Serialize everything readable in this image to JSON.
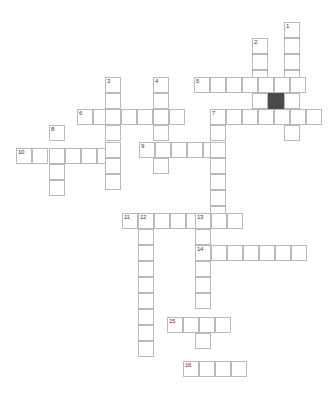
{
  "puzzle": {
    "type": "crossword-grid",
    "title": "Crossword Puzzle Grid",
    "cell_size_px": 16,
    "origin": {
      "x": 16,
      "y": 22
    },
    "colors": {
      "background": "#ffffff",
      "cell_fill": "#ffffff",
      "cell_border": "#b9b9b9",
      "blocked_fill": "#4a4a4a",
      "number_text": "#3a3a3a"
    },
    "counts": {
      "open_cells": 93,
      "blocked_cells": 1,
      "numbered_cells": 16
    },
    "clue_numbers": [
      "1",
      "2",
      "3",
      "4",
      "5",
      "6",
      "7",
      "8",
      "9",
      "10",
      "11",
      "12",
      "13",
      "14",
      "15",
      "16"
    ],
    "entries": [
      {
        "number": "1",
        "direction": "down",
        "col": 17,
        "row": 0,
        "length": 8
      },
      {
        "number": "2",
        "direction": "down",
        "col": 15,
        "row": 1,
        "length": 6
      },
      {
        "number": "3",
        "direction": "down",
        "col": 6,
        "row": 4,
        "length": 7
      },
      {
        "number": "4",
        "direction": "down",
        "col": 9,
        "row": 4,
        "length": 6
      },
      {
        "number": "5",
        "direction": "across",
        "col": 11,
        "row": 4,
        "length": 7
      },
      {
        "number": "6",
        "direction": "across",
        "col": 4,
        "row": 6,
        "length": 8
      },
      {
        "number": "7",
        "direction": "across",
        "col": 12,
        "row": 7,
        "length": 7
      },
      {
        "number": "7",
        "direction": "down",
        "col": 12,
        "row": 7,
        "length": 8
      },
      {
        "number": "8",
        "direction": "down",
        "col": 2,
        "row": 7,
        "length": 4
      },
      {
        "number": "9",
        "direction": "across",
        "col": 7,
        "row": 9,
        "length": 6
      },
      {
        "number": "10",
        "direction": "across",
        "col": 0,
        "row": 9,
        "length": 6
      },
      {
        "number": "11",
        "direction": "across",
        "col": 7,
        "row": 13,
        "length": 8
      },
      {
        "number": "12",
        "direction": "down",
        "col": 8,
        "row": 13,
        "length": 10
      },
      {
        "number": "13",
        "direction": "down",
        "col": 11,
        "row": 13,
        "length": 11
      },
      {
        "number": "14",
        "direction": "across",
        "col": 11,
        "row": 15,
        "length": 7
      },
      {
        "number": "15",
        "direction": "across",
        "col": 9,
        "row": 20,
        "length": 4
      },
      {
        "number": "16",
        "direction": "across",
        "col": 10,
        "row": 23,
        "length": 4
      }
    ],
    "cells": [
      {
        "x": 284,
        "y": 22,
        "num": "1"
      },
      {
        "x": 284,
        "y": 38
      },
      {
        "x": 252,
        "y": 38,
        "num": "2"
      },
      {
        "x": 284,
        "y": 54
      },
      {
        "x": 252,
        "y": 54
      },
      {
        "x": 284,
        "y": 70
      },
      {
        "x": 252,
        "y": 70
      },
      {
        "x": 194,
        "y": 77,
        "num": "5"
      },
      {
        "x": 210,
        "y": 77
      },
      {
        "x": 226,
        "y": 77
      },
      {
        "x": 242,
        "y": 77
      },
      {
        "x": 258,
        "y": 77
      },
      {
        "x": 274,
        "y": 77
      },
      {
        "x": 290,
        "y": 77
      },
      {
        "x": 105,
        "y": 77,
        "num": "3"
      },
      {
        "x": 153,
        "y": 77,
        "num": "4"
      },
      {
        "x": 105,
        "y": 93
      },
      {
        "x": 153,
        "y": 93
      },
      {
        "x": 252,
        "y": 93
      },
      {
        "x": 268,
        "y": 93,
        "blocked": true
      },
      {
        "x": 284,
        "y": 93
      },
      {
        "x": 77,
        "y": 109,
        "num": "6"
      },
      {
        "x": 93,
        "y": 109
      },
      {
        "x": 105,
        "y": 109
      },
      {
        "x": 121,
        "y": 109
      },
      {
        "x": 137,
        "y": 109
      },
      {
        "x": 153,
        "y": 109
      },
      {
        "x": 169,
        "y": 109
      },
      {
        "x": 210,
        "y": 109,
        "num": "7"
      },
      {
        "x": 226,
        "y": 109
      },
      {
        "x": 242,
        "y": 109
      },
      {
        "x": 258,
        "y": 109
      },
      {
        "x": 274,
        "y": 109
      },
      {
        "x": 290,
        "y": 109
      },
      {
        "x": 306,
        "y": 109
      },
      {
        "x": 49,
        "y": 125,
        "num": "8"
      },
      {
        "x": 105,
        "y": 125
      },
      {
        "x": 153,
        "y": 125
      },
      {
        "x": 210,
        "y": 125
      },
      {
        "x": 284,
        "y": 125
      },
      {
        "x": 16,
        "y": 148,
        "num": "10"
      },
      {
        "x": 32,
        "y": 148
      },
      {
        "x": 49,
        "y": 148
      },
      {
        "x": 65,
        "y": 148
      },
      {
        "x": 81,
        "y": 148
      },
      {
        "x": 97,
        "y": 148
      },
      {
        "x": 139,
        "y": 142,
        "num": "9"
      },
      {
        "x": 155,
        "y": 142
      },
      {
        "x": 171,
        "y": 142
      },
      {
        "x": 187,
        "y": 142
      },
      {
        "x": 203,
        "y": 142
      },
      {
        "x": 105,
        "y": 142
      },
      {
        "x": 105,
        "y": 158
      },
      {
        "x": 153,
        "y": 158
      },
      {
        "x": 210,
        "y": 142
      },
      {
        "x": 49,
        "y": 164
      },
      {
        "x": 105,
        "y": 174
      },
      {
        "x": 49,
        "y": 180
      },
      {
        "x": 210,
        "y": 158
      },
      {
        "x": 210,
        "y": 174
      },
      {
        "x": 210,
        "y": 190
      },
      {
        "x": 210,
        "y": 206
      },
      {
        "x": 122,
        "y": 213,
        "num": "11"
      },
      {
        "x": 138,
        "y": 213,
        "num": "12"
      },
      {
        "x": 154,
        "y": 213
      },
      {
        "x": 170,
        "y": 213
      },
      {
        "x": 186,
        "y": 213
      },
      {
        "x": 195,
        "y": 213,
        "num": "13"
      },
      {
        "x": 211,
        "y": 213
      },
      {
        "x": 227,
        "y": 213
      },
      {
        "x": 138,
        "y": 229
      },
      {
        "x": 195,
        "y": 229
      },
      {
        "x": 195,
        "y": 245,
        "num": "14"
      },
      {
        "x": 211,
        "y": 245
      },
      {
        "x": 227,
        "y": 245
      },
      {
        "x": 243,
        "y": 245
      },
      {
        "x": 259,
        "y": 245
      },
      {
        "x": 275,
        "y": 245
      },
      {
        "x": 291,
        "y": 245
      },
      {
        "x": 138,
        "y": 245
      },
      {
        "x": 138,
        "y": 261
      },
      {
        "x": 195,
        "y": 261
      },
      {
        "x": 138,
        "y": 277
      },
      {
        "x": 195,
        "y": 277
      },
      {
        "x": 138,
        "y": 293
      },
      {
        "x": 195,
        "y": 293
      },
      {
        "x": 138,
        "y": 309
      },
      {
        "x": 167,
        "y": 317,
        "num": "15"
      },
      {
        "x": 183,
        "y": 317
      },
      {
        "x": 199,
        "y": 317
      },
      {
        "x": 215,
        "y": 317
      },
      {
        "x": 138,
        "y": 325
      },
      {
        "x": 195,
        "y": 333
      },
      {
        "x": 138,
        "y": 341
      },
      {
        "x": 183,
        "y": 361,
        "num": "16"
      },
      {
        "x": 199,
        "y": 361
      },
      {
        "x": 215,
        "y": 361
      },
      {
        "x": 231,
        "y": 361
      }
    ]
  }
}
